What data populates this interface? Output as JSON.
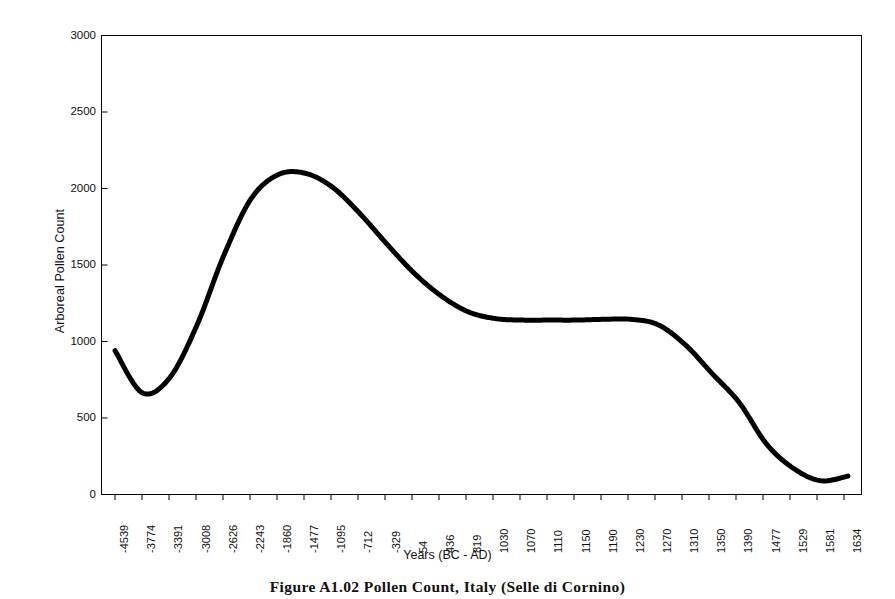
{
  "figure": {
    "caption": "Figure A1.02   Pollen Count, Italy (Selle di Cornino)"
  },
  "chart_data": {
    "type": "line",
    "title": "",
    "xlabel": "Years (BC - AD)",
    "ylabel": "Arboreal Pollen Count",
    "ylim": [
      0,
      3000
    ],
    "ytick_labels": [
      "3000",
      "2500",
      "2000",
      "1500",
      "1000",
      "500",
      "0"
    ],
    "yticks": [
      3000,
      2500,
      2000,
      1500,
      1000,
      500,
      0
    ],
    "grid": false,
    "legend": false,
    "line_color": "#000000",
    "frame_color": "#000000",
    "categories": [
      "-4539",
      "-3774",
      "-3391",
      "-3008",
      "-2626",
      "-2243",
      "-1860",
      "-1477",
      "-1095",
      "-712",
      "-329",
      "54",
      "436",
      "819",
      "1030",
      "1070",
      "1110",
      "1150",
      "1190",
      "1230",
      "1270",
      "1310",
      "1350",
      "1390",
      "1477",
      "1529",
      "1581",
      "1634"
    ],
    "x": [
      -4539,
      -3774,
      -3391,
      -3008,
      -2626,
      -2243,
      -1860,
      -1477,
      -1095,
      -712,
      -329,
      54,
      436,
      819,
      1030,
      1070,
      1110,
      1150,
      1190,
      1230,
      1270,
      1310,
      1350,
      1390,
      1477,
      1529,
      1581,
      1634
    ],
    "values": [
      940,
      665,
      760,
      1100,
      1560,
      1930,
      2090,
      2100,
      2010,
      1840,
      1640,
      1450,
      1300,
      1195,
      1150,
      1140,
      1140,
      1140,
      1145,
      1145,
      1110,
      980,
      790,
      600,
      330,
      170,
      90,
      120
    ],
    "series": [
      {
        "name": "Arboreal Pollen Count",
        "values": [
          940,
          665,
          760,
          1100,
          1560,
          1930,
          2090,
          2100,
          2010,
          1840,
          1640,
          1450,
          1300,
          1195,
          1150,
          1140,
          1140,
          1140,
          1145,
          1145,
          1110,
          980,
          790,
          600,
          330,
          170,
          90,
          120
        ]
      }
    ],
    "annotations": {
      "peak_value": 2100,
      "peak_category": "-1477",
      "first_minimum_value": 665,
      "first_minimum_category": "-3774",
      "final_minimum_value": 90,
      "final_minimum_category": "1581",
      "plateau_value": 1140
    }
  }
}
